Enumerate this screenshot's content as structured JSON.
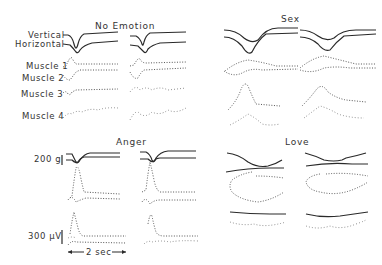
{
  "figure": {
    "panels": [
      {
        "id": "no-emotion",
        "title": "No Emotion"
      },
      {
        "id": "sex",
        "title": "Sex"
      },
      {
        "id": "anger",
        "title": "Anger"
      },
      {
        "id": "love",
        "title": "Love"
      }
    ],
    "channel_labels": {
      "vertical": "Vertical",
      "horizontal": "Horizontal",
      "muscle1": "Muscle 1",
      "muscle2": "Muscle 2",
      "muscle3": "Muscle 3",
      "muscle4": "Muscle 4"
    },
    "scale_bars": {
      "force": "200 g",
      "voltage": "300 μV",
      "time": "2 sec"
    }
  }
}
